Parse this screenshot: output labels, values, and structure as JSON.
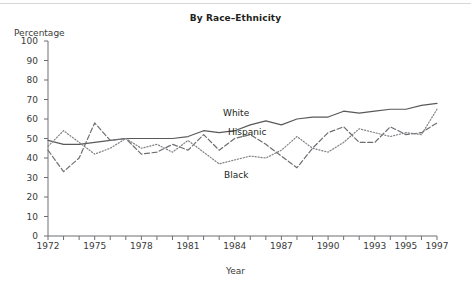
{
  "chart_data": {
    "type": "line",
    "title": "By Race–Ethnicity",
    "xlabel": "Year",
    "ylabel": "Percentage",
    "ylim": [
      0,
      100
    ],
    "xlim": [
      1972,
      1997
    ],
    "grid": false,
    "legend_position": "inline",
    "ytick_labels": [
      "0",
      "10",
      "20",
      "30",
      "40",
      "50",
      "60",
      "70",
      "80",
      "90",
      "100"
    ],
    "yticks": [
      0,
      10,
      20,
      30,
      40,
      50,
      60,
      70,
      80,
      90,
      100
    ],
    "xtick_labels": [
      "1972",
      "1975",
      "1978",
      "1981",
      "1984",
      "1987",
      "1990",
      "1993",
      "1995",
      "1997"
    ],
    "xticks": [
      1972,
      1975,
      1978,
      1981,
      1984,
      1987,
      1990,
      1993,
      1995,
      1997
    ],
    "x": [
      1972,
      1973,
      1974,
      1975,
      1976,
      1977,
      1978,
      1979,
      1980,
      1981,
      1982,
      1983,
      1984,
      1985,
      1986,
      1987,
      1988,
      1989,
      1990,
      1991,
      1992,
      1993,
      1994,
      1995,
      1996,
      1997
    ],
    "series": [
      {
        "name": "White",
        "style": "solid",
        "color": "#58595b",
        "values": [
          49,
          47,
          47,
          48,
          49,
          50,
          50,
          50,
          50,
          51,
          54,
          53,
          54,
          57,
          59,
          57,
          60,
          61,
          61,
          64,
          63,
          64,
          65,
          65,
          67,
          68
        ]
      },
      {
        "name": "Hispanic",
        "style": "dashed",
        "color": "#6d6e71",
        "values": [
          44,
          33,
          40,
          58,
          49,
          50,
          42,
          43,
          47,
          44,
          52,
          44,
          50,
          52,
          47,
          41,
          35,
          45,
          53,
          56,
          48,
          48,
          56,
          52,
          53,
          58
        ]
      },
      {
        "name": "Black",
        "style": "dotted",
        "color": "#808285",
        "values": [
          46,
          54,
          48,
          42,
          45,
          50,
          45,
          47,
          43,
          49,
          43,
          37,
          39,
          41,
          40,
          44,
          51,
          45,
          43,
          48,
          55,
          53,
          51,
          53,
          52,
          65
        ]
      }
    ],
    "annotations": [
      {
        "text": "White",
        "x": 1983.5,
        "y": 62
      },
      {
        "text": "Hispanic",
        "x": 1984,
        "y": 54
      },
      {
        "text": "Black",
        "x": 1984,
        "y": 33
      }
    ]
  }
}
